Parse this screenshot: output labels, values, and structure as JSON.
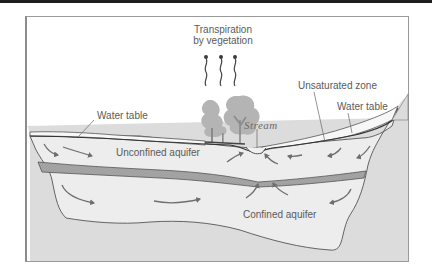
{
  "diagram": {
    "labels": {
      "transpiration_line1": "Transpiration",
      "transpiration_line2": "by vegetation",
      "unsaturated_zone": "Unsaturated zone",
      "water_table_left": "Water table",
      "water_table_right": "Water table",
      "stream": "Stream",
      "unconfined_aquifer": "Unconfined aquifer",
      "confined_aquifer": "Confined aquifer"
    },
    "colors": {
      "background": "#ffffff",
      "bedrock": "#dcdcdc",
      "aquifer_fill": "#ededed",
      "confining_layer": "#a8a8a8",
      "unsaturated_fill": "#f6f6f6",
      "outline": "#555555",
      "arrows": "#6e6e6e",
      "trees": "#b4b4b4",
      "frame": "#9a9a9a",
      "top_bar": "#1e1e1e"
    },
    "elements": [
      "unsaturated zone",
      "water table",
      "unconfined aquifer",
      "confining layer",
      "confined aquifer",
      "stream",
      "vegetation",
      "transpiration arrows",
      "flow arrows"
    ]
  }
}
